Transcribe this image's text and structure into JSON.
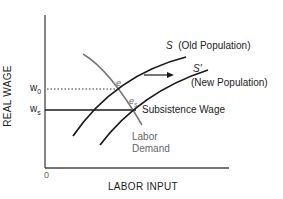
{
  "diagram": {
    "type": "economics-labor-market",
    "axes": {
      "ylabel": "REAL WAGE",
      "xlabel": "LABOR INPUT",
      "origin": "0"
    },
    "wage_levels": {
      "w0": {
        "label": "w",
        "sub": "0"
      },
      "ws": {
        "label": "w",
        "sub": "s"
      }
    },
    "curves": {
      "supply_old": {
        "symbol": "S",
        "label": "(Old Population)"
      },
      "supply_new": {
        "symbol": "S'",
        "label": "(New Population)"
      },
      "demand": {
        "line1": "Labor",
        "line2": "Demand"
      },
      "subsistence": {
        "label": "Subsistence Wage"
      }
    },
    "points": {
      "e": "e",
      "es": {
        "label": "e",
        "sub": "s"
      }
    },
    "colors": {
      "axis": "#444444",
      "supply": "#1a1a1a",
      "demand": "#777777",
      "text": "#222222"
    }
  }
}
